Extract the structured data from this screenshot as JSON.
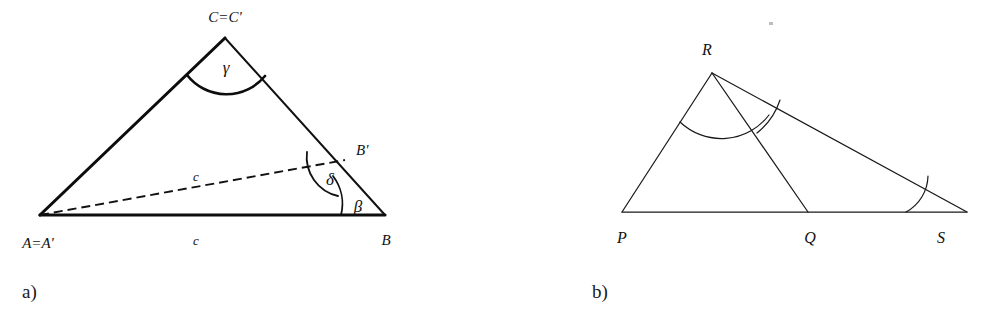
{
  "figure": {
    "background_color": "#ffffff",
    "ink_color": "#111111",
    "width": 998,
    "height": 326
  },
  "panels": [
    {
      "id": "panel-a",
      "caption": "a)",
      "caption_pos": {
        "x": 22,
        "y": 298
      },
      "points": {
        "A": {
          "x": 40,
          "y": 215
        },
        "B": {
          "x": 385,
          "y": 215
        },
        "C": {
          "x": 225,
          "y": 38
        },
        "Bp": {
          "x": 345,
          "y": 160
        }
      },
      "edges": [
        {
          "name": "edge-A-C",
          "weight": "thick",
          "from": "A",
          "to": "C"
        },
        {
          "name": "edge-C-B",
          "weight": "med",
          "from": "C",
          "to": "B"
        },
        {
          "name": "edge-A-B",
          "weight": "thick",
          "from": "A",
          "to": "B"
        },
        {
          "name": "edge-A-Bprime",
          "weight": "dash",
          "from": "A",
          "to": "Bp"
        }
      ],
      "arcs": [
        {
          "name": "angle-arc-gamma",
          "weight": "thick",
          "d": "M 187 75 A 50 50 0 0 0 265 76"
        },
        {
          "name": "angle-arc-delta",
          "weight": "med",
          "d": "M 307 152 A 40 40 0 0 0 338 196"
        },
        {
          "name": "angle-arc-beta",
          "weight": "med",
          "d": "M 333 176 A 46 46 0 0 1 341 215"
        }
      ],
      "labels": [
        {
          "name": "label-point-C",
          "text": "C=C'",
          "x": 225,
          "y": 22,
          "anchor": "middle",
          "size": "pt"
        },
        {
          "name": "label-point-A",
          "text": "A=A'",
          "x": 38,
          "y": 248,
          "anchor": "middle",
          "size": "pt"
        },
        {
          "name": "label-point-B",
          "text": "B",
          "x": 386,
          "y": 245,
          "anchor": "middle",
          "size": "pt"
        },
        {
          "name": "label-point-Bprime",
          "text": "B'",
          "x": 356,
          "y": 155,
          "anchor": "start",
          "size": "pt"
        },
        {
          "name": "label-side-c-dashed",
          "text": "c",
          "x": 196,
          "y": 181,
          "anchor": "middle",
          "size": "side"
        },
        {
          "name": "label-side-c-base",
          "text": "c",
          "x": 196,
          "y": 245,
          "anchor": "middle",
          "size": "side"
        },
        {
          "name": "label-angle-gamma",
          "text": "γ",
          "x": 226,
          "y": 73,
          "anchor": "middle",
          "size": "ang"
        },
        {
          "name": "label-angle-delta",
          "text": "δ",
          "x": 330,
          "y": 185,
          "anchor": "middle",
          "size": "ang"
        },
        {
          "name": "label-angle-beta",
          "text": "β",
          "x": 358,
          "y": 212,
          "anchor": "middle",
          "size": "ang"
        }
      ]
    },
    {
      "id": "panel-b",
      "caption": "b)",
      "caption_pos": {
        "x": 592,
        "y": 298
      },
      "points": {
        "P": {
          "x": 622,
          "y": 212
        },
        "Q": {
          "x": 808,
          "y": 212
        },
        "S": {
          "x": 967,
          "y": 212
        },
        "R": {
          "x": 712,
          "y": 73
        }
      },
      "edges": [
        {
          "name": "edge-P-R",
          "weight": "thin",
          "from": "P",
          "to": "R"
        },
        {
          "name": "edge-R-S",
          "weight": "thin",
          "from": "R",
          "to": "S"
        },
        {
          "name": "edge-P-S",
          "weight": "thin",
          "from": "P",
          "to": "S"
        },
        {
          "name": "edge-R-Q",
          "weight": "thin",
          "from": "R",
          "to": "Q"
        }
      ],
      "arcs": [
        {
          "name": "angle-arc-PRQ",
          "weight": "thin",
          "d": "M 680 122 A 60 60 0 0 0 769 115"
        },
        {
          "name": "angle-arc-QRS",
          "weight": "thin",
          "d": "M 757 133 A 70 70 0 0 0 780 100"
        },
        {
          "name": "angle-arc-S",
          "weight": "thin",
          "d": "M 906 212 A 42 42 0 0 0 928 176"
        }
      ],
      "labels": [
        {
          "name": "label-point-R",
          "text": "R",
          "x": 707,
          "y": 55,
          "anchor": "middle",
          "size": "ptb"
        },
        {
          "name": "label-point-P",
          "text": "P",
          "x": 622,
          "y": 243,
          "anchor": "middle",
          "size": "ptb"
        },
        {
          "name": "label-point-Q",
          "text": "Q",
          "x": 810,
          "y": 243,
          "anchor": "middle",
          "size": "ptb"
        },
        {
          "name": "label-point-S",
          "text": "S",
          "x": 941,
          "y": 243,
          "anchor": "middle",
          "size": "ptb"
        }
      ],
      "speck": {
        "x": 769,
        "y": 22,
        "w": 4,
        "h": 3
      }
    }
  ]
}
